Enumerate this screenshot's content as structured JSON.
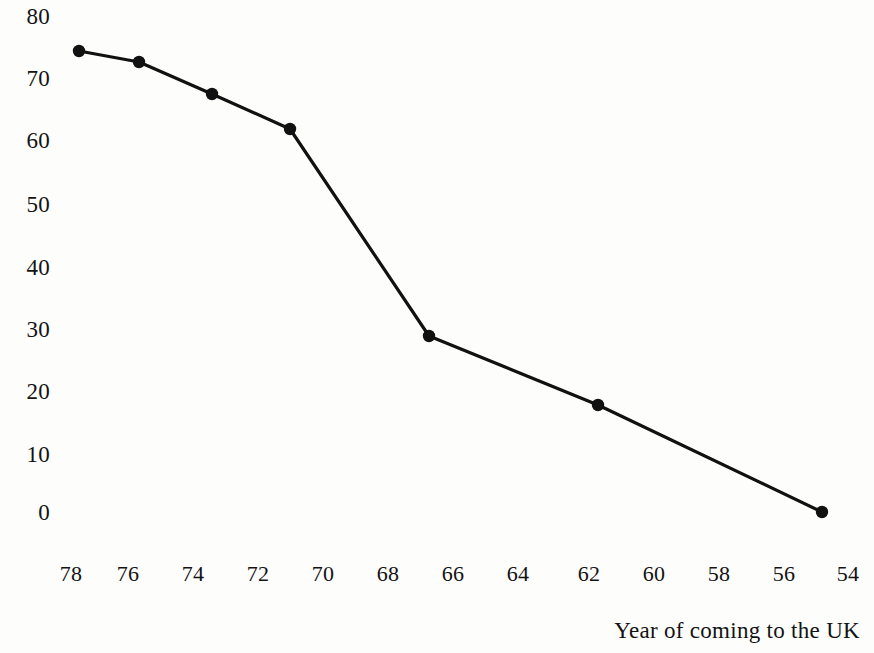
{
  "chart_data": {
    "type": "line",
    "title": "",
    "subtitle": "",
    "xlabel": "Year of coming to the UK",
    "ylabel": "",
    "x": [
      77.8,
      75.9,
      74.6,
      71.2,
      67.0,
      61.7,
      54.8
    ],
    "values": [
      74.5,
      72.7,
      67.6,
      62.0,
      29.0,
      18.0,
      0.5
    ],
    "series": [
      {
        "name": "",
        "x": [
          77.8,
          75.9,
          74.6,
          71.2,
          67.0,
          61.7,
          54.8
        ],
        "values": [
          74.5,
          72.7,
          67.6,
          62.0,
          29.0,
          18.0,
          0.5
        ]
      }
    ],
    "xticks": [
      "78",
      "76",
      "74",
      "72",
      "70",
      "68",
      "66",
      "64",
      "62",
      "60",
      "58",
      "56",
      "54"
    ],
    "yticks": [
      "80",
      "70",
      "60",
      "50",
      "40",
      "30",
      "20",
      "10",
      "0"
    ],
    "xlim": [
      79,
      53
    ],
    "ylim": [
      0,
      80
    ],
    "x_axis_inverted": true,
    "grid": false,
    "legend": false,
    "marker": "filled-circle",
    "line_color": "#111111",
    "marker_color": "#111111",
    "background_color": "#fdfdfc"
  },
  "axis": {
    "x_title": "Year of coming to the UK",
    "ticks_x": [
      {
        "label": "78",
        "px": 71
      },
      {
        "label": "76",
        "px": 128
      },
      {
        "label": "74",
        "px": 193
      },
      {
        "label": "72",
        "px": 258
      },
      {
        "label": "70",
        "px": 323
      },
      {
        "label": "68",
        "px": 388
      },
      {
        "label": "66",
        "px": 453
      },
      {
        "label": "64",
        "px": 518
      },
      {
        "label": "62",
        "px": 589
      },
      {
        "label": "60",
        "px": 654
      },
      {
        "label": "58",
        "px": 719
      },
      {
        "label": "56",
        "px": 784
      },
      {
        "label": "54",
        "px": 848
      }
    ],
    "ticks_y": [
      {
        "label": "80",
        "px": 17
      },
      {
        "label": "70",
        "px": 79
      },
      {
        "label": "60",
        "px": 141
      },
      {
        "label": "50",
        "px": 205
      },
      {
        "label": "40",
        "px": 268
      },
      {
        "label": "30",
        "px": 330
      },
      {
        "label": "20",
        "px": 392
      },
      {
        "label": "10",
        "px": 455
      },
      {
        "label": "0",
        "px": 513
      }
    ]
  },
  "points_px": [
    {
      "x": 79,
      "y": 51
    },
    {
      "x": 139,
      "y": 62
    },
    {
      "x": 212,
      "y": 94
    },
    {
      "x": 290,
      "y": 129
    },
    {
      "x": 429,
      "y": 336
    },
    {
      "x": 598,
      "y": 405
    },
    {
      "x": 822,
      "y": 512
    }
  ]
}
